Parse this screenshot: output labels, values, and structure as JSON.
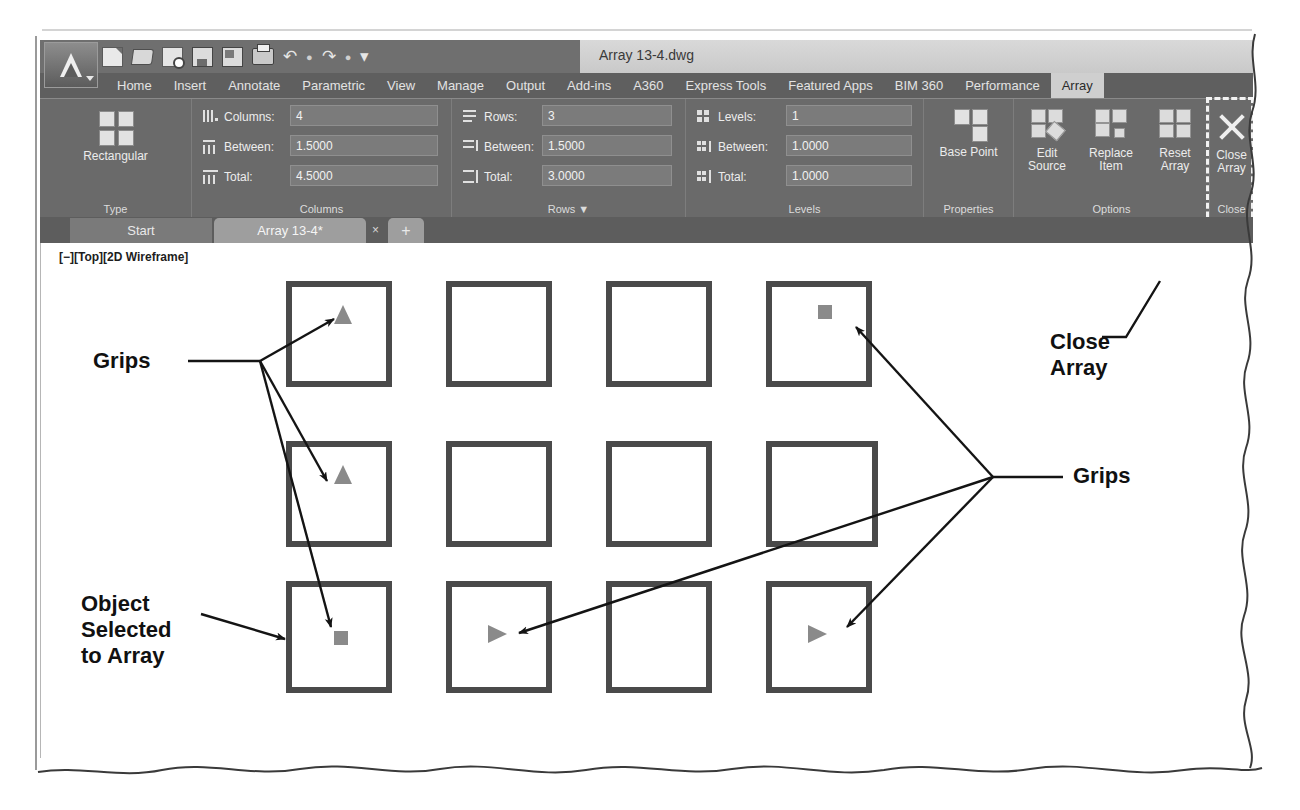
{
  "window": {
    "title": "Array 13-4.dwg",
    "app_menu": "application-menu",
    "quick_access": [
      {
        "name": "new-icon",
        "label": "New"
      },
      {
        "name": "open-icon",
        "label": "Open"
      },
      {
        "name": "save-as-icon",
        "label": "Save As"
      },
      {
        "name": "save-icon",
        "label": "Save"
      },
      {
        "name": "plot-preview-icon",
        "label": "Plot Preview"
      },
      {
        "name": "plot-icon",
        "label": "Plot"
      },
      {
        "name": "undo-icon",
        "label": "Undo"
      },
      {
        "name": "redo-icon",
        "label": "Redo"
      },
      {
        "name": "customize-icon",
        "label": "Customize"
      }
    ]
  },
  "ribbon": {
    "tabs": [
      {
        "label": "Home",
        "active": false
      },
      {
        "label": "Insert",
        "active": false
      },
      {
        "label": "Annotate",
        "active": false
      },
      {
        "label": "Parametric",
        "active": false
      },
      {
        "label": "View",
        "active": false
      },
      {
        "label": "Manage",
        "active": false
      },
      {
        "label": "Output",
        "active": false
      },
      {
        "label": "Add-ins",
        "active": false
      },
      {
        "label": "A360",
        "active": false
      },
      {
        "label": "Express Tools",
        "active": false
      },
      {
        "label": "Featured Apps",
        "active": false
      },
      {
        "label": "BIM 360",
        "active": false
      },
      {
        "label": "Performance",
        "active": false
      },
      {
        "label": "Array",
        "active": true
      }
    ],
    "panels": {
      "type": {
        "label": "Type",
        "button": "Rectangular"
      },
      "columns": {
        "label": "Columns",
        "fields": [
          {
            "label": "Columns:",
            "value": "4"
          },
          {
            "label": "Between:",
            "value": "1.5000"
          },
          {
            "label": "Total:",
            "value": "4.5000"
          }
        ]
      },
      "rows": {
        "label": "Rows",
        "expander": "▼",
        "fields": [
          {
            "label": "Rows:",
            "value": "3"
          },
          {
            "label": "Between:",
            "value": "1.5000"
          },
          {
            "label": "Total:",
            "value": "3.0000"
          }
        ]
      },
      "levels": {
        "label": "Levels",
        "fields": [
          {
            "label": "Levels:",
            "value": "1"
          },
          {
            "label": "Between:",
            "value": "1.0000"
          },
          {
            "label": "Total:",
            "value": "1.0000"
          }
        ]
      },
      "properties": {
        "label": "Properties",
        "button": "Base Point"
      },
      "options": {
        "label": "Options",
        "buttons": [
          "Edit Source",
          "Replace Item",
          "Reset Array"
        ]
      },
      "close": {
        "label": "Close",
        "button": "Close Array"
      }
    }
  },
  "doc_tabs": [
    {
      "label": "Start",
      "active": false,
      "closeable": false
    },
    {
      "label": "Array 13-4*",
      "active": true,
      "closeable": true,
      "close_glyph": "×"
    },
    {
      "label": "+",
      "active": false,
      "closeable": false
    }
  ],
  "drawing": {
    "viewport_label": "[−][Top][2D Wireframe]",
    "array": {
      "columns": 4,
      "rows": 3,
      "grips": [
        {
          "row": 0,
          "col": 0,
          "shape": "triangle-up"
        },
        {
          "row": 0,
          "col": 3,
          "shape": "square"
        },
        {
          "row": 1,
          "col": 0,
          "shape": "triangle-up"
        },
        {
          "row": 2,
          "col": 0,
          "shape": "square"
        },
        {
          "row": 2,
          "col": 1,
          "shape": "triangle-right"
        },
        {
          "row": 2,
          "col": 3,
          "shape": "triangle-right"
        }
      ]
    },
    "annotations": [
      {
        "id": "grips-left",
        "text": "Grips"
      },
      {
        "id": "grips-right",
        "text": "Grips"
      },
      {
        "id": "object-selected",
        "text": "Object\nSelected\nto Array"
      },
      {
        "id": "close-array",
        "text": "Close\nArray"
      }
    ],
    "annotation_text": {
      "grips_left": "Grips",
      "grips_right": "Grips",
      "object_selected_l1": "Object",
      "object_selected_l2": "Selected",
      "object_selected_l3": "to Array",
      "close_array_l1": "Close",
      "close_array_l2": "Array"
    }
  },
  "colors": {
    "ribbon_bg": "#6a6a6a",
    "tab_active": "#cfcfcf",
    "field_bg": "#7b7b7b",
    "grip_gray": "#8a8a8a",
    "square_stroke": "#4a4a4a",
    "annotation": "#111111"
  }
}
